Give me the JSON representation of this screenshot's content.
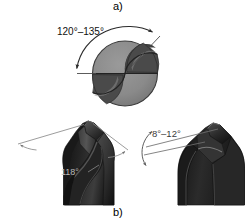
{
  "figure": {
    "background_color": "#ffffff",
    "width": 245,
    "height": 223
  },
  "panels": [
    {
      "id": "a",
      "caption": "a)",
      "description": "End view of twist drill point showing included point angle range",
      "labels": [
        {
          "id": "point-angle-range",
          "text": "120°–135°",
          "color": "#111111"
        }
      ]
    },
    {
      "id": "b",
      "caption": "b)",
      "description": "Side views of twist drill showing point angle and lip clearance angle",
      "labels": [
        {
          "id": "point-angle",
          "text": "118°",
          "color": "#b9b9b9"
        },
        {
          "id": "clearance-angle",
          "text": "8°–12°",
          "color": "#3a3a3a"
        }
      ]
    }
  ],
  "captions": {
    "a": "a)",
    "b": "b)"
  },
  "dimensions": {
    "point_angle_range": "120°–135°",
    "point_angle": "118°",
    "clearance_angle": "8°–12°"
  },
  "colors": {
    "background": "#ffffff",
    "mid_gray": "#8d8d8d",
    "dark_gray": "#4b4b4b",
    "darker_gray": "#3a3a3a",
    "near_black": "#1d1d1d",
    "outline": "#2a2a2a",
    "leader_line": "#7d7d7d",
    "label_text": "#111111",
    "label_text_light": "#b9b9b9"
  }
}
